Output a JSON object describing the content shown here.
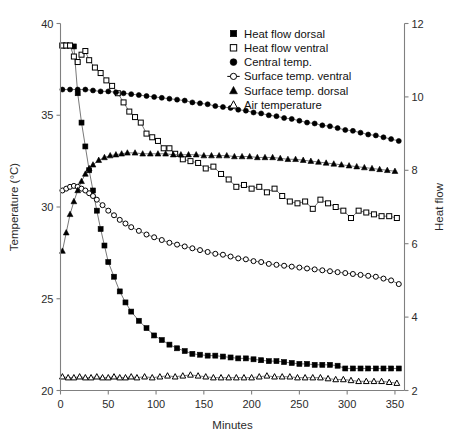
{
  "chart_data": {
    "type": "line",
    "title": "",
    "xlabel": "Minutes",
    "ylabel": "Temperature (°C)",
    "ylabel_right": "Heat flow",
    "xlim": [
      0,
      360
    ],
    "ylim": [
      20,
      40
    ],
    "ylim_right": [
      2,
      12
    ],
    "xticks": [
      0,
      50,
      100,
      150,
      200,
      250,
      300,
      350
    ],
    "yticks": [
      20,
      25,
      30,
      35,
      40
    ],
    "yticks_right": [
      2,
      4,
      6,
      8,
      10,
      12
    ],
    "grid": false,
    "legend_position": "top-right",
    "series": [
      {
        "name": "Heat flow dorsal",
        "marker": "filled-square",
        "axis": "right",
        "x": [
          2,
          6,
          10,
          14,
          18,
          22,
          26,
          30,
          34,
          38,
          42,
          46,
          50,
          56,
          62,
          68,
          74,
          82,
          90,
          98,
          106,
          114,
          122,
          130,
          138,
          146,
          154,
          162,
          170,
          178,
          186,
          194,
          202,
          210,
          218,
          226,
          234,
          242,
          250,
          258,
          266,
          274,
          282,
          290,
          298,
          306,
          314,
          322,
          330,
          338,
          346,
          354
        ],
        "values_temp": [
          38.8,
          38.8,
          38.8,
          38.75,
          36.2,
          34.6,
          33.3,
          32.0,
          30.9,
          29.8,
          28.8,
          27.9,
          27.0,
          26.2,
          25.4,
          24.8,
          24.3,
          23.8,
          23.4,
          23.0,
          22.75,
          22.5,
          22.3,
          22.15,
          22.0,
          21.95,
          21.9,
          21.9,
          21.85,
          21.8,
          21.75,
          21.75,
          21.7,
          21.65,
          21.6,
          21.6,
          21.55,
          21.5,
          21.45,
          21.45,
          21.4,
          21.4,
          21.4,
          21.35,
          21.2,
          21.2,
          21.2,
          21.2,
          21.2,
          21.2,
          21.2,
          21.2
        ],
        "values_heatflow": [
          11.4,
          11.4,
          11.4,
          11.38,
          10.1,
          9.3,
          8.65,
          8.0,
          7.45,
          6.9,
          6.4,
          5.95,
          5.5,
          5.1,
          4.7,
          4.4,
          4.15,
          3.9,
          3.7,
          3.5,
          3.38,
          3.25,
          3.15,
          3.08,
          3.0,
          2.98,
          2.95,
          2.95,
          2.93,
          2.9,
          2.88,
          2.88,
          2.85,
          2.83,
          2.8,
          2.8,
          2.78,
          2.75,
          2.73,
          2.73,
          2.7,
          2.7,
          2.7,
          2.68,
          2.6,
          2.6,
          2.6,
          2.6,
          2.6,
          2.6,
          2.6,
          2.6
        ]
      },
      {
        "name": "Heat flow ventral",
        "marker": "open-square",
        "axis": "right",
        "x": [
          2,
          6,
          10,
          14,
          18,
          22,
          26,
          30,
          36,
          42,
          48,
          54,
          60,
          66,
          72,
          78,
          84,
          90,
          96,
          102,
          108,
          114,
          120,
          128,
          136,
          144,
          152,
          160,
          168,
          176,
          184,
          192,
          200,
          208,
          216,
          224,
          232,
          240,
          248,
          256,
          264,
          272,
          280,
          288,
          296,
          304,
          312,
          320,
          328,
          336,
          344,
          352
        ],
        "values_temp": [
          38.8,
          38.8,
          38.8,
          38.2,
          37.9,
          38.3,
          38.5,
          38.0,
          37.6,
          37.3,
          36.9,
          36.6,
          36.2,
          35.7,
          35.2,
          34.9,
          34.6,
          34.0,
          33.8,
          33.6,
          33.2,
          33.2,
          32.9,
          32.6,
          32.5,
          32.4,
          32.1,
          32.2,
          31.8,
          31.5,
          31.1,
          31.2,
          31.0,
          31.1,
          30.8,
          31.0,
          30.6,
          30.3,
          30.2,
          30.3,
          29.9,
          30.4,
          30.2,
          30.0,
          29.8,
          29.4,
          29.8,
          29.7,
          29.6,
          29.5,
          29.5,
          29.4
        ],
        "values_heatflow": [
          11.4,
          11.4,
          11.4,
          11.1,
          10.95,
          11.15,
          11.25,
          11.0,
          10.8,
          10.65,
          10.45,
          10.3,
          10.1,
          9.85,
          9.6,
          9.45,
          9.3,
          9.0,
          8.9,
          8.8,
          8.6,
          8.6,
          8.45,
          8.3,
          8.25,
          8.2,
          8.05,
          8.1,
          7.9,
          7.75,
          7.55,
          7.6,
          7.5,
          7.55,
          7.4,
          7.5,
          7.3,
          7.15,
          7.1,
          7.15,
          6.95,
          7.2,
          7.1,
          7.0,
          6.9,
          6.7,
          6.9,
          6.85,
          6.8,
          6.75,
          6.75,
          6.7
        ]
      },
      {
        "name": "Central temp.",
        "marker": "filled-circle",
        "axis": "left",
        "x": [
          2,
          10,
          18,
          26,
          34,
          42,
          50,
          58,
          66,
          74,
          82,
          90,
          98,
          106,
          114,
          122,
          130,
          138,
          146,
          154,
          162,
          170,
          178,
          186,
          194,
          202,
          210,
          218,
          226,
          234,
          242,
          250,
          258,
          266,
          274,
          282,
          290,
          298,
          306,
          314,
          322,
          330,
          338,
          346,
          354
        ],
        "values_temp": [
          36.4,
          36.4,
          36.4,
          36.4,
          36.35,
          36.3,
          36.3,
          36.25,
          36.2,
          36.15,
          36.1,
          36.05,
          36.0,
          35.95,
          35.9,
          35.85,
          35.8,
          35.7,
          35.65,
          35.6,
          35.5,
          35.45,
          35.4,
          35.3,
          35.25,
          35.15,
          35.1,
          35.0,
          34.95,
          34.85,
          34.8,
          34.7,
          34.6,
          34.55,
          34.45,
          34.4,
          34.3,
          34.2,
          34.15,
          34.05,
          33.95,
          33.9,
          33.8,
          33.7,
          33.6
        ]
      },
      {
        "name": "Surface temp. ventral",
        "marker": "open-circle",
        "axis": "left",
        "x": [
          2,
          6,
          10,
          14,
          18,
          22,
          26,
          30,
          34,
          38,
          44,
          50,
          56,
          62,
          68,
          74,
          82,
          90,
          98,
          106,
          114,
          122,
          130,
          138,
          146,
          154,
          162,
          170,
          178,
          186,
          194,
          202,
          210,
          218,
          226,
          234,
          242,
          250,
          258,
          266,
          274,
          282,
          290,
          298,
          306,
          314,
          322,
          330,
          338,
          346,
          354
        ],
        "values_temp": [
          30.9,
          31.0,
          31.1,
          31.15,
          31.1,
          31.0,
          30.9,
          30.75,
          30.6,
          30.4,
          30.1,
          29.8,
          29.55,
          29.3,
          29.1,
          28.9,
          28.7,
          28.5,
          28.35,
          28.2,
          28.05,
          27.95,
          27.85,
          27.75,
          27.65,
          27.55,
          27.45,
          27.4,
          27.3,
          27.2,
          27.15,
          27.05,
          27.0,
          26.9,
          26.85,
          26.8,
          26.75,
          26.7,
          26.65,
          26.6,
          26.55,
          26.5,
          26.45,
          26.4,
          26.35,
          26.3,
          26.25,
          26.2,
          26.1,
          26.0,
          25.8
        ]
      },
      {
        "name": "Surface temp. dorsal",
        "marker": "filled-triangle",
        "axis": "left",
        "x": [
          2,
          6,
          10,
          14,
          18,
          22,
          26,
          30,
          34,
          40,
          46,
          52,
          58,
          64,
          70,
          78,
          86,
          94,
          102,
          110,
          118,
          126,
          134,
          142,
          150,
          158,
          166,
          174,
          182,
          190,
          198,
          206,
          214,
          222,
          230,
          238,
          246,
          254,
          262,
          270,
          278,
          286,
          294,
          302,
          310,
          318,
          326,
          334,
          342,
          350
        ],
        "values_temp": [
          27.6,
          28.6,
          29.6,
          30.3,
          30.9,
          31.4,
          31.8,
          32.1,
          32.3,
          32.55,
          32.7,
          32.8,
          32.85,
          32.9,
          32.95,
          32.95,
          32.9,
          32.9,
          32.9,
          32.9,
          32.85,
          32.85,
          32.85,
          32.85,
          32.8,
          32.8,
          32.8,
          32.8,
          32.75,
          32.75,
          32.75,
          32.7,
          32.7,
          32.7,
          32.65,
          32.6,
          32.6,
          32.55,
          32.5,
          32.45,
          32.4,
          32.35,
          32.3,
          32.25,
          32.2,
          32.15,
          32.1,
          32.05,
          32.0,
          31.95
        ]
      },
      {
        "name": "Air temperature",
        "marker": "open-triangle",
        "axis": "left",
        "x": [
          2,
          8,
          14,
          20,
          26,
          32,
          38,
          44,
          50,
          56,
          62,
          68,
          74,
          80,
          88,
          96,
          104,
          112,
          120,
          128,
          136,
          144,
          152,
          160,
          168,
          176,
          184,
          192,
          200,
          208,
          216,
          224,
          232,
          240,
          248,
          256,
          264,
          272,
          280,
          288,
          296,
          304,
          312,
          320,
          328,
          336,
          344,
          352
        ],
        "values_temp": [
          20.75,
          20.7,
          20.7,
          20.75,
          20.7,
          20.7,
          20.75,
          20.7,
          20.7,
          20.75,
          20.7,
          20.7,
          20.75,
          20.7,
          20.75,
          20.7,
          20.75,
          20.8,
          20.75,
          20.8,
          20.85,
          20.8,
          20.75,
          20.7,
          20.7,
          20.7,
          20.7,
          20.7,
          20.7,
          20.75,
          20.8,
          20.75,
          20.75,
          20.75,
          20.7,
          20.7,
          20.7,
          20.7,
          20.65,
          20.6,
          20.6,
          20.55,
          20.5,
          20.5,
          20.5,
          20.5,
          20.45,
          20.4
        ]
      }
    ]
  },
  "legend": {
    "items": [
      {
        "label": "Heat flow dorsal",
        "marker": "filled-square"
      },
      {
        "label": "Heat flow ventral",
        "marker": "open-square"
      },
      {
        "label": "Central temp.",
        "marker": "filled-circle"
      },
      {
        "label": "Surface temp. ventral",
        "marker": "open-circle-tick"
      },
      {
        "label": "Surface temp. dorsal",
        "marker": "filled-triangle"
      },
      {
        "label": "Air temperature",
        "marker": "open-triangle"
      }
    ]
  },
  "axes": {
    "x_title": "Minutes",
    "y_left_title": "Temperature (°C)",
    "y_right_title": "Heat flow",
    "x_tick_labels": [
      "0",
      "50",
      "100",
      "150",
      "200",
      "250",
      "300",
      "350"
    ],
    "y_left_tick_labels": [
      "20",
      "25",
      "30",
      "35",
      "40"
    ],
    "y_right_tick_labels": [
      "2",
      "4",
      "6",
      "8",
      "10",
      "12"
    ]
  },
  "colors": {
    "axis": "#808080",
    "text": "#1a1a1a",
    "series_line": "#555555",
    "marker_fill": "#000000",
    "background": "#ffffff"
  }
}
